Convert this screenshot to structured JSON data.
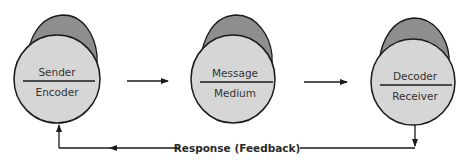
{
  "diagram": {
    "type": "communication-process-model",
    "colors": {
      "face_fill": "#d6d6d6",
      "top_fill": "#8e8e8e",
      "stroke": "#1a1a1a",
      "background": "#ffffff"
    },
    "nodes": [
      {
        "id": "sender",
        "top_label": "Sender",
        "bottom_label": "Encoder"
      },
      {
        "id": "message",
        "top_label": "Message",
        "bottom_label": "Medium"
      },
      {
        "id": "receiver",
        "top_label": "Decoder",
        "bottom_label": "Receiver"
      }
    ],
    "edges": [
      {
        "from": "sender",
        "to": "message",
        "direction": "right"
      },
      {
        "from": "message",
        "to": "receiver",
        "direction": "right"
      },
      {
        "from": "receiver",
        "to": "sender",
        "label": "Response (Feedback)",
        "route": "below"
      }
    ],
    "feedback_label": "Response (Feedback)"
  }
}
